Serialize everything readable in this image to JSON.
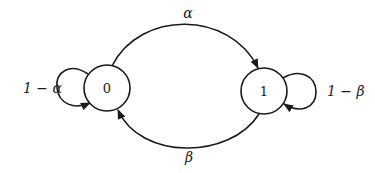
{
  "diagram": {
    "type": "markov-chain-state-diagram",
    "states": [
      {
        "id": "0",
        "label": "0"
      },
      {
        "id": "1",
        "label": "1"
      }
    ],
    "transitions": [
      {
        "from": "0",
        "to": "1",
        "label": "α"
      },
      {
        "from": "1",
        "to": "0",
        "label": "β"
      },
      {
        "from": "0",
        "to": "0",
        "label": "1 − α"
      },
      {
        "from": "1",
        "to": "1",
        "label": "1 − β"
      }
    ],
    "colors": {
      "stroke": "#1a1a1a",
      "background": "#ffffff"
    }
  }
}
